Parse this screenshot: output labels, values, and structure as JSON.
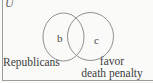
{
  "diagram": {
    "type": "venn",
    "universal_set_label": "U",
    "left_circle": {
      "region_label": "b",
      "caption": "Republicans"
    },
    "right_circle": {
      "region_label": "c",
      "caption_line1": "favor",
      "caption_line2": "death penalty"
    },
    "colors": {
      "background": "#fafaf8",
      "stroke": "#8f8f8f",
      "text": "#3d3d3d"
    }
  }
}
